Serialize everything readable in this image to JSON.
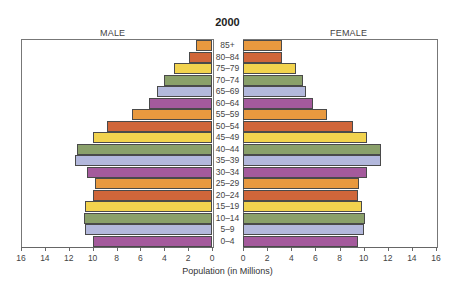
{
  "chart_data": {
    "type": "bar",
    "subtype": "population-pyramid",
    "title": "2000",
    "left_label": "MALE",
    "right_label": "FEMALE",
    "xlabel": "Population (in Millions)",
    "ylabel": "",
    "xlim": [
      0,
      16
    ],
    "xticks": [
      0,
      2,
      4,
      6,
      8,
      10,
      12,
      14,
      16
    ],
    "categories": [
      "85+",
      "80–84",
      "75–79",
      "70–74",
      "65–69",
      "60–64",
      "55–59",
      "50–54",
      "45–49",
      "40–44",
      "35–39",
      "30–34",
      "25–29",
      "20–24",
      "15–19",
      "10–14",
      "5–9",
      "0–4"
    ],
    "series": [
      {
        "name": "MALE",
        "values": [
          1.3,
          1.9,
          3.2,
          4.0,
          4.6,
          5.3,
          6.7,
          8.8,
          10.0,
          11.3,
          11.5,
          10.5,
          9.8,
          10.0,
          10.6,
          10.7,
          10.6,
          10.0
        ]
      },
      {
        "name": "FEMALE",
        "values": [
          3.2,
          3.2,
          4.4,
          5.0,
          5.2,
          5.8,
          7.0,
          9.1,
          10.3,
          11.4,
          11.4,
          10.3,
          9.6,
          9.5,
          9.9,
          10.1,
          10.0,
          9.5
        ]
      }
    ],
    "bar_colors": [
      "#e8993f",
      "#d0663a",
      "#f2d34e",
      "#8aa06a",
      "#b3b8dc",
      "#a45a9c",
      "#e8993f",
      "#d0663a",
      "#f2d34e",
      "#8aa06a",
      "#b3b8dc",
      "#a45a9c",
      "#e8993f",
      "#d0663a",
      "#f2d34e",
      "#8aa06a",
      "#b3b8dc",
      "#a45a9c"
    ],
    "grid": false,
    "legend": "none"
  }
}
